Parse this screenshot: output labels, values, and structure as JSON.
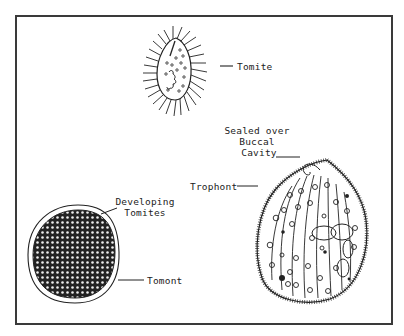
{
  "figure": {
    "labels": {
      "tomite": "Tomite",
      "sealed_line1": "Sealed over",
      "sealed_line2": "Buccal",
      "sealed_line3": "Cavity",
      "trophont": "Trophont",
      "developing_line1": "Developing",
      "developing_line2": "Tomites",
      "tomont": "Tomont"
    },
    "colors": {
      "ink": "#222222",
      "frame": "#3a3a3a",
      "background": "#ffffff"
    }
  }
}
